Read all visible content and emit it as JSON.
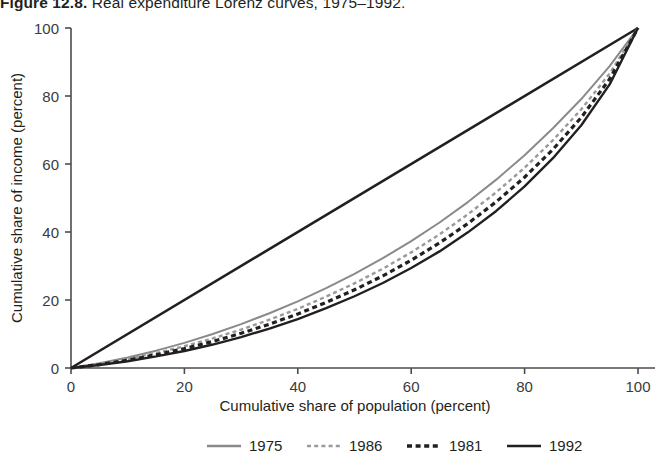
{
  "title": {
    "number": "Figure 12.8.",
    "caption": "Real expenditure Lorenz curves, 1975–1992."
  },
  "chart_data": {
    "type": "line",
    "title": "Real expenditure Lorenz curves, 1975–1992.",
    "xlabel": "Cumulative share of population (percent)",
    "ylabel": "Cumulative share of income (percent)",
    "xlim": [
      0,
      100
    ],
    "ylim": [
      0,
      100
    ],
    "xticks": [
      0,
      20,
      40,
      60,
      80,
      100
    ],
    "yticks": [
      0,
      20,
      40,
      60,
      80,
      100
    ],
    "xticklabels": [
      "0",
      "20",
      "40",
      "60",
      "80",
      "100"
    ],
    "yticklabels": [
      "0",
      "20",
      "40",
      "60",
      "80",
      "100"
    ],
    "grid": false,
    "legend_position": "below-axis",
    "x": [
      0,
      5,
      10,
      15,
      20,
      25,
      30,
      35,
      40,
      45,
      50,
      55,
      60,
      65,
      70,
      75,
      80,
      85,
      90,
      95,
      100
    ],
    "series": [
      {
        "name": "1975",
        "color": "#8a8a8a",
        "style": "solid",
        "width": 2.0,
        "values": [
          0,
          1.4,
          3.1,
          5.1,
          7.4,
          10.0,
          12.9,
          16.1,
          19.6,
          23.5,
          27.7,
          32.3,
          37.3,
          42.8,
          48.8,
          55.4,
          62.6,
          70.5,
          79.1,
          88.8,
          100
        ]
      },
      {
        "name": "1986",
        "color": "#9a9a9a",
        "style": "dashed",
        "width": 2.4,
        "values": [
          0,
          1.2,
          2.7,
          4.4,
          6.4,
          8.7,
          11.3,
          14.2,
          17.4,
          21.0,
          24.9,
          29.2,
          34.0,
          39.3,
          45.2,
          51.7,
          58.9,
          67.0,
          76.1,
          86.6,
          100
        ]
      },
      {
        "name": "1981",
        "color": "#231f20",
        "style": "dashed-bold",
        "width": 3.2,
        "values": [
          0,
          1.0,
          2.3,
          3.9,
          5.7,
          7.8,
          10.2,
          12.9,
          15.9,
          19.3,
          23.0,
          27.1,
          31.7,
          36.8,
          42.5,
          48.9,
          56.1,
          64.3,
          73.7,
          85.0,
          100
        ]
      },
      {
        "name": "1992",
        "color": "#231f20",
        "style": "solid",
        "width": 2.4,
        "values": [
          0,
          0.9,
          2.0,
          3.4,
          5.0,
          6.9,
          9.1,
          11.6,
          14.4,
          17.6,
          21.1,
          25.0,
          29.4,
          34.3,
          39.9,
          46.2,
          53.4,
          61.7,
          71.4,
          83.4,
          100
        ]
      }
    ],
    "equality_line": {
      "name": "line-of-equality",
      "color": "#231f20",
      "style": "solid",
      "from": [
        0,
        0
      ],
      "to": [
        100,
        100
      ]
    }
  },
  "legend": {
    "items": [
      {
        "label": "1975",
        "color": "#8a8a8a",
        "style": "solid"
      },
      {
        "label": "1986",
        "color": "#9a9a9a",
        "style": "dashed"
      },
      {
        "label": "1981",
        "color": "#231f20",
        "style": "dashed-bold"
      },
      {
        "label": "1992",
        "color": "#231f20",
        "style": "solid"
      }
    ]
  }
}
